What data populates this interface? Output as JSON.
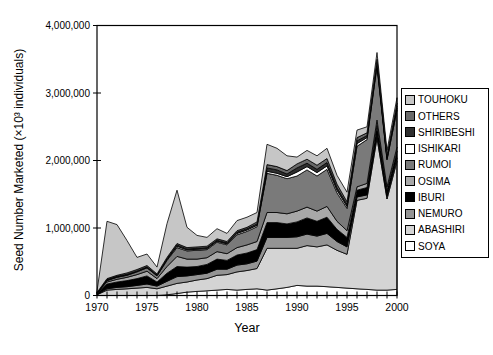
{
  "chart_data": {
    "type": "area",
    "stacked": true,
    "title": "",
    "xlabel": "Year",
    "ylabel": "Seed Number Marketed (×10³ individuals)",
    "xlim": [
      1970,
      2000
    ],
    "ylim": [
      0,
      4000000
    ],
    "x": [
      1970,
      1971,
      1972,
      1973,
      1974,
      1975,
      1976,
      1977,
      1978,
      1979,
      1980,
      1981,
      1982,
      1983,
      1984,
      1985,
      1986,
      1987,
      1988,
      1989,
      1990,
      1991,
      1992,
      1993,
      1994,
      1995,
      1996,
      1997,
      1998,
      1999,
      2000
    ],
    "x_tick_values": [
      1970,
      1975,
      1980,
      1985,
      1990,
      1995,
      2000
    ],
    "x_tick_labels": [
      "1970",
      "1975",
      "1980",
      "1985",
      "1990",
      "1995",
      "2000"
    ],
    "x_minor_tick_every": 1,
    "y_ticks": [
      0,
      1000000,
      2000000,
      3000000,
      4000000
    ],
    "y_tick_labels": [
      "0",
      "1,000,000",
      "2,000,000",
      "3,000,000",
      "4,000,000"
    ],
    "grid": false,
    "legend_position": "right-outside",
    "legend_order": "reverse_of_series",
    "frame_color": "#000000",
    "background_color": "#ffffff",
    "series": [
      {
        "name": "SOYA",
        "color": "#ffffff",
        "values": [
          0,
          0,
          0,
          0,
          0,
          0,
          0,
          10000,
          30000,
          50000,
          60000,
          70000,
          80000,
          90000,
          80000,
          90000,
          100000,
          80000,
          100000,
          120000,
          150000,
          140000,
          140000,
          130000,
          120000,
          110000,
          100000,
          90000,
          80000,
          80000,
          90000
        ]
      },
      {
        "name": "ABASHIRI",
        "color": "#d4d4d4",
        "values": [
          10000,
          80000,
          90000,
          100000,
          110000,
          120000,
          100000,
          130000,
          150000,
          150000,
          170000,
          180000,
          220000,
          220000,
          270000,
          280000,
          300000,
          620000,
          600000,
          580000,
          550000,
          600000,
          580000,
          620000,
          550000,
          500000,
          1310000,
          1350000,
          2250000,
          1350000,
          1900000
        ]
      },
      {
        "name": "NEMURO",
        "color": "#949494",
        "values": [
          5000,
          20000,
          30000,
          30000,
          40000,
          50000,
          40000,
          70000,
          100000,
          90000,
          80000,
          80000,
          90000,
          80000,
          100000,
          100000,
          110000,
          160000,
          160000,
          160000,
          170000,
          170000,
          160000,
          170000,
          130000,
          110000,
          50000,
          50000,
          60000,
          40000,
          50000
        ]
      },
      {
        "name": "IBURI",
        "color": "#000000",
        "values": [
          10000,
          70000,
          80000,
          90000,
          100000,
          120000,
          60000,
          120000,
          150000,
          130000,
          120000,
          130000,
          150000,
          130000,
          150000,
          160000,
          170000,
          220000,
          220000,
          200000,
          220000,
          240000,
          220000,
          240000,
          180000,
          140000,
          100000,
          110000,
          130000,
          90000,
          100000
        ]
      },
      {
        "name": "OSIMA",
        "color": "#a8a8a8",
        "values": [
          5000,
          30000,
          40000,
          50000,
          60000,
          70000,
          50000,
          100000,
          150000,
          120000,
          110000,
          100000,
          110000,
          100000,
          110000,
          120000,
          120000,
          150000,
          150000,
          150000,
          160000,
          160000,
          150000,
          160000,
          120000,
          100000,
          50000,
          60000,
          80000,
          50000,
          60000
        ]
      },
      {
        "name": "RUMOI",
        "color": "#7a7a7a",
        "values": [
          5000,
          20000,
          30000,
          30000,
          40000,
          50000,
          40000,
          90000,
          130000,
          120000,
          130000,
          120000,
          140000,
          130000,
          190000,
          200000,
          220000,
          580000,
          550000,
          520000,
          520000,
          550000,
          520000,
          550000,
          420000,
          330000,
          600000,
          650000,
          800000,
          400000,
          550000
        ]
      },
      {
        "name": "ISHIKARI",
        "color": "#ffffff",
        "values": [
          0,
          5000,
          5000,
          5000,
          5000,
          5000,
          5000,
          10000,
          20000,
          15000,
          15000,
          15000,
          15000,
          15000,
          20000,
          20000,
          20000,
          30000,
          30000,
          30000,
          60000,
          50000,
          50000,
          50000,
          40000,
          30000,
          40000,
          30000,
          30000,
          20000,
          30000
        ]
      },
      {
        "name": "SHIRIBESHI",
        "color": "#2e2e2e",
        "values": [
          5000,
          10000,
          10000,
          10000,
          10000,
          10000,
          10000,
          15000,
          20000,
          15000,
          15000,
          15000,
          15000,
          15000,
          20000,
          20000,
          20000,
          50000,
          50000,
          40000,
          60000,
          50000,
          50000,
          50000,
          40000,
          30000,
          40000,
          30000,
          30000,
          20000,
          30000
        ]
      },
      {
        "name": "OTHERS",
        "color": "#696969",
        "values": [
          5000,
          15000,
          15000,
          20000,
          20000,
          20000,
          15000,
          20000,
          20000,
          20000,
          20000,
          20000,
          20000,
          20000,
          20000,
          20000,
          30000,
          50000,
          50000,
          50000,
          60000,
          60000,
          60000,
          60000,
          50000,
          40000,
          50000,
          40000,
          40000,
          30000,
          40000
        ]
      },
      {
        "name": "TOUHOKU",
        "color": "#c6c6c6",
        "values": [
          20000,
          850000,
          750000,
          480000,
          180000,
          170000,
          100000,
          500000,
          790000,
          300000,
          170000,
          130000,
          150000,
          120000,
          150000,
          150000,
          140000,
          300000,
          270000,
          220000,
          100000,
          130000,
          140000,
          150000,
          130000,
          140000,
          110000,
          90000,
          100000,
          70000,
          80000
        ]
      }
    ]
  }
}
